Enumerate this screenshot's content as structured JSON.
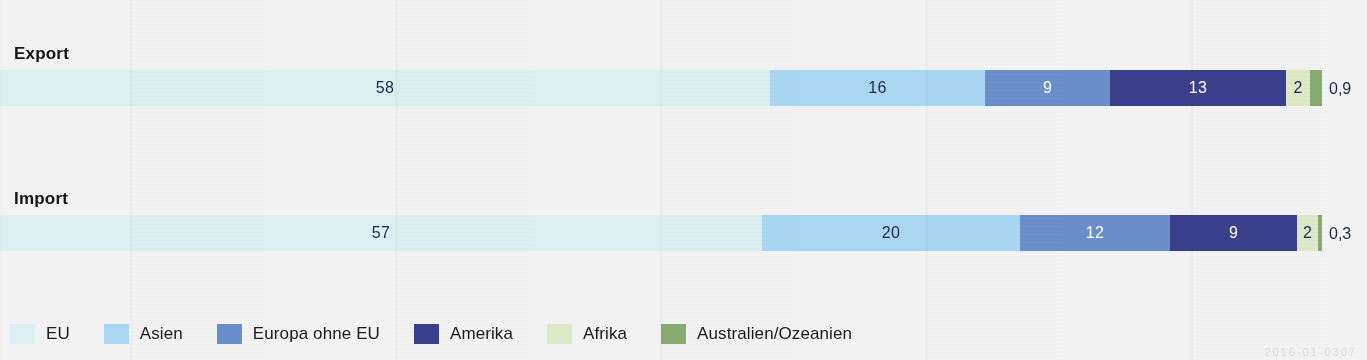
{
  "chart_data": {
    "type": "bar",
    "subtype": "stacked-horizontal-100",
    "title": "",
    "xlabel": "",
    "ylabel": "",
    "categories": [
      "Export",
      "Import"
    ],
    "value_unit": "percent",
    "legend_position": "bottom",
    "grid": false,
    "xlim": [
      0,
      100
    ],
    "series": [
      {
        "name": "EU",
        "color": "#dbeff1",
        "values": [
          58,
          57
        ],
        "labels": [
          "58",
          "57"
        ],
        "label_color": "dark"
      },
      {
        "name": "Asien",
        "color": "#a9d7f2",
        "values": [
          16,
          20
        ],
        "labels": [
          "16",
          "20"
        ],
        "label_color": "dark"
      },
      {
        "name": "Europa ohne EU",
        "color": "#6a8ec9",
        "values": [
          9,
          12
        ],
        "labels": [
          "9",
          "12"
        ],
        "label_color": "light"
      },
      {
        "name": "Amerika",
        "color": "#3a3f8c",
        "values": [
          13,
          9
        ],
        "labels": [
          "13",
          "9"
        ],
        "label_color": "light"
      },
      {
        "name": "Afrika",
        "color": "#dde8c6",
        "values": [
          2,
          2
        ],
        "labels": [
          "2",
          "2"
        ],
        "label_color": "dark"
      },
      {
        "name": "Australien/Ozeanien",
        "color": "#8aaa74",
        "values": [
          0.9,
          0.3
        ],
        "labels": [
          "0,9",
          "0,3"
        ],
        "label_color": "dark",
        "label_outside": true
      }
    ]
  },
  "rows": [
    {
      "label": "Export",
      "segments": [
        {
          "series": "EU",
          "label": "58",
          "width_px": 770,
          "label_mode": "inside",
          "tone": "light"
        },
        {
          "series": "Asien",
          "label": "16",
          "width_px": 215,
          "label_mode": "inside",
          "tone": "light"
        },
        {
          "series": "Europa ohne EU",
          "label": "9",
          "width_px": 125,
          "label_mode": "inside",
          "tone": "dark"
        },
        {
          "series": "Amerika",
          "label": "13",
          "width_px": 176,
          "label_mode": "inside",
          "tone": "dark"
        },
        {
          "series": "Afrika",
          "label": "2",
          "width_px": 24,
          "label_mode": "inside",
          "tone": "light"
        },
        {
          "series": "Australien/Ozeanien",
          "label": "0,9",
          "width_px": 12,
          "label_mode": "outside",
          "tone": "light"
        }
      ]
    },
    {
      "label": "Import",
      "segments": [
        {
          "series": "EU",
          "label": "57",
          "width_px": 762,
          "label_mode": "inside",
          "tone": "light"
        },
        {
          "series": "Asien",
          "label": "20",
          "width_px": 258,
          "label_mode": "inside",
          "tone": "light"
        },
        {
          "series": "Europa ohne EU",
          "label": "12",
          "width_px": 150,
          "label_mode": "inside",
          "tone": "dark"
        },
        {
          "series": "Amerika",
          "label": "9",
          "width_px": 127,
          "label_mode": "inside",
          "tone": "dark"
        },
        {
          "series": "Afrika",
          "label": "2",
          "width_px": 21,
          "label_mode": "inside",
          "tone": "light"
        },
        {
          "series": "Australien/Ozeanien",
          "label": "0,3",
          "width_px": 4,
          "label_mode": "outside",
          "tone": "light"
        }
      ]
    }
  ],
  "legend": {
    "items": [
      {
        "label": "EU",
        "color": "#dbeff1"
      },
      {
        "label": "Asien",
        "color": "#a9d7f2"
      },
      {
        "label": "Europa ohne EU",
        "color": "#6a8ec9"
      },
      {
        "label": "Amerika",
        "color": "#3a3f8c"
      },
      {
        "label": "Afrika",
        "color": "#dde8c6"
      },
      {
        "label": "Australien/Ozeanien",
        "color": "#8aaa74"
      }
    ]
  },
  "watermark": {
    "text": "2016-01-0307"
  },
  "colors": {
    "background": "#f2f2f2",
    "text": "#1a1a1a",
    "value_dark": "#1b2a4a",
    "value_light": "#ffffff"
  }
}
